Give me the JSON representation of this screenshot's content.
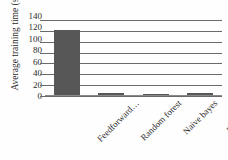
{
  "chart_data": {
    "type": "bar",
    "title": "",
    "xlabel": "",
    "ylabel": "Average training time (s)",
    "categories": [
      "Feedforward…",
      "Random forest",
      "Naive bayes",
      "Fuzzy logic"
    ],
    "values": [
      121,
      5,
      4,
      6
    ],
    "ylim": [
      0,
      140
    ],
    "yticks": [
      0,
      20,
      40,
      60,
      80,
      100,
      120,
      140
    ],
    "ytick_labels": [
      "0",
      "20",
      "40",
      "60",
      "80",
      "100",
      "120",
      "140"
    ],
    "grid": true,
    "legend": false,
    "legend_position": "none",
    "bar_color": "#575757",
    "gridline_color": "#6a6a6a",
    "axis_color": "#8a8a8a",
    "background": "#fefefe",
    "xtick_rotation": -45
  }
}
